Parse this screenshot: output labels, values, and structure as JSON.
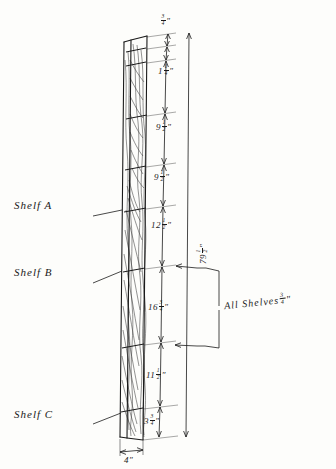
{
  "drawing": {
    "title": "Bookcase side-panel elevation with shelf spacing dimensions",
    "ink_color": "#1a1a1a",
    "paper_color": "#fdfdfb"
  },
  "shelf_labels": [
    {
      "name": "shelf-a",
      "text": "Shelf A"
    },
    {
      "name": "shelf-b",
      "text": "Shelf B"
    },
    {
      "name": "shelf-c",
      "text": "Shelf C"
    }
  ],
  "notes": [
    {
      "name": "all-shelves-thickness",
      "text": "All Shelves",
      "fraction_num": "3",
      "fraction_den": "4",
      "unit": "″"
    }
  ],
  "dimensions": [
    {
      "name": "dim-top",
      "whole": "",
      "num": "3",
      "den": "4",
      "unit": "″",
      "position": "top"
    },
    {
      "name": "dim-1",
      "whole": "1",
      "num": "1",
      "den": "4",
      "unit": "″",
      "position": "second"
    },
    {
      "name": "dim-2",
      "whole": "9",
      "num": "1",
      "den": "2",
      "unit": "″",
      "position": "third"
    },
    {
      "name": "dim-3",
      "whole": "9",
      "num": "1",
      "den": "2",
      "unit": "″",
      "position": "fourth"
    },
    {
      "name": "dim-4",
      "whole": "12",
      "num": "1",
      "den": "2",
      "unit": "″",
      "position": "fifth"
    },
    {
      "name": "dim-5",
      "whole": "16",
      "num": "3",
      "den": "4",
      "unit": "″",
      "position": "sixth"
    },
    {
      "name": "dim-6",
      "whole": "11",
      "num": "1",
      "den": "2",
      "unit": "″",
      "position": "seventh"
    },
    {
      "name": "dim-bottom",
      "whole": "3",
      "num": "3",
      "den": "4",
      "unit": "″",
      "position": "bottom"
    },
    {
      "name": "dim-overall-height",
      "whole": "79",
      "num": "1",
      "den": "2",
      "unit": "″",
      "position": "overall-right"
    },
    {
      "name": "dim-depth",
      "whole": "4",
      "num": "",
      "den": "",
      "unit": "″",
      "position": "bottom-width"
    }
  ]
}
